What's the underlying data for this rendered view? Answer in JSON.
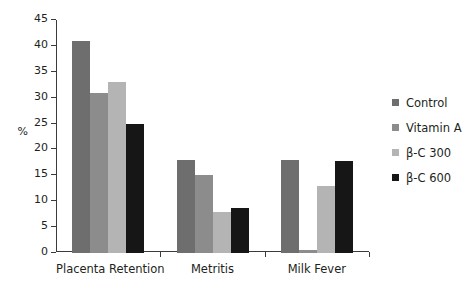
{
  "chart_data": {
    "type": "bar",
    "title": "",
    "subtitle": "",
    "xlabel": "",
    "ylabel": "%",
    "ylim": [
      0,
      45
    ],
    "yticks": [
      0,
      5,
      10,
      15,
      20,
      25,
      30,
      35,
      40,
      45
    ],
    "ytick_labels": [
      "0",
      "5",
      "10",
      "15",
      "20",
      "25",
      "30",
      "35",
      "40",
      "45"
    ],
    "grid": false,
    "legend_position": "right",
    "categories": [
      "Placenta Retention",
      "Metritis",
      "Milk Fever"
    ],
    "series": [
      {
        "name": "Control",
        "color": "#6e6e6e",
        "values": [
          41,
          18,
          18
        ]
      },
      {
        "name": "Vitamin A",
        "color": "#8c8c8c",
        "values": [
          31,
          15,
          0.5
        ]
      },
      {
        "name": "β-C 300",
        "color": "#b4b4b4",
        "values": [
          33,
          8,
          13
        ]
      },
      {
        "name": "β-C 600",
        "color": "#161616",
        "values": [
          25,
          8.6,
          17.7
        ]
      }
    ]
  },
  "axis": {
    "y_label": "%"
  }
}
